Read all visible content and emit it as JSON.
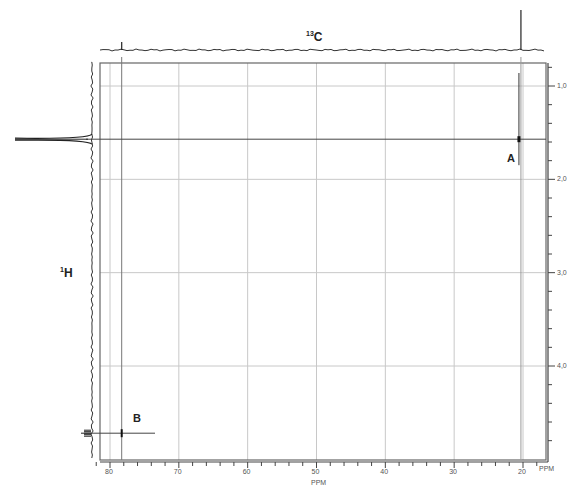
{
  "chart_data": {
    "type": "heatmap",
    "subtype": "2D NMR correlation spectrum (HSQC/HETCOR)",
    "title": "",
    "top_projection_label": {
      "sup": "13",
      "text": "C"
    },
    "left_projection_label": {
      "sup": "1",
      "text": "H"
    },
    "xlabel": "PPM",
    "ylabel": "PPM",
    "xlim": [
      82,
      18
    ],
    "ylim": [
      0.75,
      4.95
    ],
    "x_ticks": [
      80,
      70,
      60,
      50,
      40,
      30,
      20
    ],
    "x_tick_labels": [
      "80",
      "70",
      "60",
      "50",
      "40",
      "30",
      "20"
    ],
    "y_ticks": [
      1.0,
      2.0,
      3.0,
      4.0
    ],
    "y_tick_labels": [
      "1,0",
      "2,0",
      "3,0",
      "4,0"
    ],
    "grid": true,
    "cross_peaks": [
      {
        "label": "A",
        "x_ppm": 20.3,
        "y_ppm": 1.57
      },
      {
        "label": "B",
        "x_ppm": 78.3,
        "y_ppm": 4.72
      }
    ],
    "carbon_1d_peaks": [
      {
        "ppm": 78.3,
        "relative_height": 0.2
      },
      {
        "ppm": 20.3,
        "relative_height": 1.0
      }
    ],
    "proton_1d_peaks": [
      {
        "ppm": 1.57,
        "relative_height": 1.0,
        "multiplicity": "singlet"
      },
      {
        "ppm": 4.72,
        "relative_height": 0.45,
        "multiplicity": "multiplet"
      }
    ]
  },
  "labels": {
    "peak_a": "A",
    "peak_b": "B",
    "x_unit_right": "PPM",
    "x_unit_center": "PPM"
  }
}
